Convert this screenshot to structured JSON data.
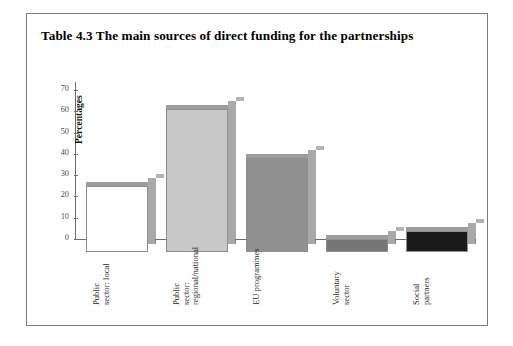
{
  "figure": {
    "title": "Table 4.3 The main sources of direct funding for the partnerships"
  },
  "chart_data": {
    "type": "bar",
    "title": "Table 4.3 The main sources of direct funding for the partnerships",
    "xlabel": "",
    "ylabel": "Percentages",
    "ylim": [
      0,
      70
    ],
    "yticks": [
      0,
      10,
      20,
      30,
      40,
      50,
      60,
      70
    ],
    "grid": false,
    "legend": "none",
    "categories": [
      "Public sector: local",
      "Public sector: regional/national",
      "EU programmes",
      "Voluntary sector",
      "Social partners"
    ],
    "category_lines": [
      [
        "Public",
        "sector: local"
      ],
      [
        "Public",
        "sector:",
        "regional/national"
      ],
      [
        "EU programmes"
      ],
      [
        "Voluntary",
        "sector"
      ],
      [
        "Social",
        "partners"
      ]
    ],
    "values": [
      31,
      67,
      44,
      6,
      10
    ],
    "bar_colors": [
      "#ffffff",
      "#c8c8c8",
      "#909090",
      "#757575",
      "#1a1a1a"
    ]
  },
  "colors": {
    "frame": "#7a7a7a",
    "axis": "#6e6e6e",
    "shadow": "#a9a9a9",
    "text": "#1a1a1a"
  }
}
